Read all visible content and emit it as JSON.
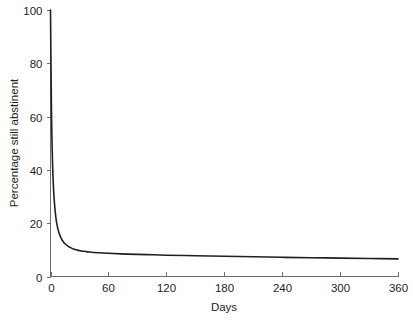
{
  "chart_data": {
    "type": "line",
    "title": "",
    "subtitle": "",
    "xlabel": "Days",
    "ylabel": "Percentage still abstinent",
    "xlim": [
      0,
      360
    ],
    "ylim": [
      0,
      100
    ],
    "xticks": [
      0,
      60,
      120,
      180,
      240,
      300,
      360
    ],
    "yticks": [
      0,
      20,
      40,
      60,
      80,
      100
    ],
    "xtick_labels": [
      "0",
      "60",
      "120",
      "180",
      "240",
      "300",
      "360"
    ],
    "ytick_labels": [
      "0",
      "20",
      "40",
      "60",
      "80",
      "100"
    ],
    "grid": false,
    "legend": false,
    "legend_position": "none",
    "line_color": "#231f20",
    "axis_color": "#6d6e71",
    "background_color": "#ffffff",
    "annotations": [],
    "series": [
      {
        "name": "Percentage still abstinent",
        "color": "#231f20",
        "x": [
          0,
          1,
          2,
          3,
          4,
          5,
          6,
          7,
          8,
          9,
          10,
          12,
          14,
          16,
          18,
          20,
          24,
          28,
          32,
          36,
          40,
          50,
          60,
          80,
          100,
          120,
          150,
          180,
          210,
          240,
          270,
          300,
          330,
          360
        ],
        "values": [
          100,
          62,
          44,
          34,
          28,
          24,
          21,
          19,
          17.4,
          16.2,
          15.2,
          13.7,
          12.7,
          12,
          11.4,
          11,
          10.3,
          9.9,
          9.6,
          9.4,
          9.2,
          8.9,
          8.7,
          8.4,
          8.2,
          8.0,
          7.8,
          7.6,
          7.4,
          7.2,
          7.05,
          6.9,
          6.75,
          6.6
        ]
      }
    ]
  },
  "figure": {
    "xlabel": "Days",
    "ylabel": "Percentage still abstinent"
  }
}
